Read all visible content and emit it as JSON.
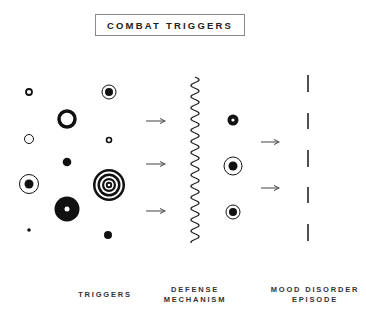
{
  "title": "COMBAT TRIGGERS",
  "labels": {
    "triggers": "TRIGGERS",
    "defense_line1": "DEFENSE",
    "defense_line2": "MECHANISM",
    "mood_line1": "MOOD DISORDER",
    "mood_line2": "EPISODE"
  },
  "colors": {
    "ink": "#111111",
    "arrow": "#555555",
    "border": "#8a8a8a"
  },
  "stages": [
    {
      "name": "triggers",
      "trigger_shape_count": 12
    },
    {
      "name": "defense-mechanism",
      "element": "wavy-line"
    },
    {
      "name": "processed-triggers",
      "shape_count": 3
    },
    {
      "name": "mood-disorder-episode",
      "element": "dashed-line",
      "dash_count": 5
    }
  ],
  "arrows": {
    "into_defense": 3,
    "into_episode": 2
  }
}
